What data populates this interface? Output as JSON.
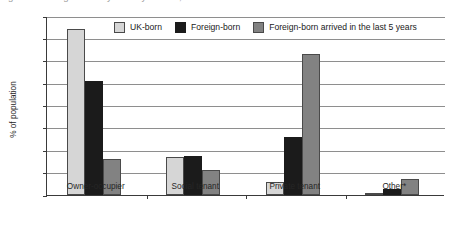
{
  "figure": {
    "title_clipped": "Figure: Housing tenure by country of birth, 2008",
    "ylabel": "% of population"
  },
  "legend": {
    "position": "top-center-inside",
    "entries": [
      {
        "label": "UK-born",
        "color": "#d6d6d6",
        "swatch_name": "legend-swatch-uk-born"
      },
      {
        "label": "Foreign-born",
        "color": "#1b1b1b",
        "swatch_name": "legend-swatch-foreign-born"
      },
      {
        "label": "Foreign-born arrived in the last 5 years",
        "color": "#828282",
        "swatch_name": "legend-swatch-foreign-born-5y"
      }
    ]
  },
  "chart_data": {
    "type": "bar",
    "title": "",
    "xlabel": "",
    "ylabel": "% of population",
    "ylim": [
      0,
      80
    ],
    "yticks": [
      0,
      10,
      20,
      30,
      40,
      50,
      60,
      70,
      80
    ],
    "ytick_labels": [
      "0",
      "10",
      "20",
      "30",
      "40",
      "50",
      "60",
      "70",
      "80"
    ],
    "grid": "horizontal",
    "legend_position": "top-center",
    "categories": [
      "Owner-occupier",
      "Social tenant",
      "Private tenant",
      "Other*"
    ],
    "series": [
      {
        "name": "UK-born",
        "color": "#d6d6d6",
        "values": [
          74,
          17,
          6,
          0.7
        ]
      },
      {
        "name": "Foreign-born",
        "color": "#1b1b1b",
        "values": [
          51,
          17.5,
          26,
          2.5
        ]
      },
      {
        "name": "Foreign-born arrived in the last 5 years",
        "color": "#828282",
        "values": [
          16,
          11,
          63,
          7
        ]
      }
    ],
    "footnote_marker": "*"
  }
}
